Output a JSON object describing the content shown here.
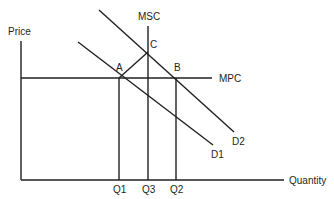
{
  "diagram": {
    "axes": {
      "y_label": "Price",
      "x_label": "Quantity"
    },
    "curves": {
      "mpc": "MPC",
      "msc": "MSC",
      "d1": "D1",
      "d2": "D2"
    },
    "points": {
      "a": "A",
      "b": "B",
      "c": "C"
    },
    "quantities": {
      "q1": "Q1",
      "q3": "Q3",
      "q2": "Q2"
    },
    "colors": {
      "ink": "#231f20",
      "background": "#ffffff"
    }
  }
}
